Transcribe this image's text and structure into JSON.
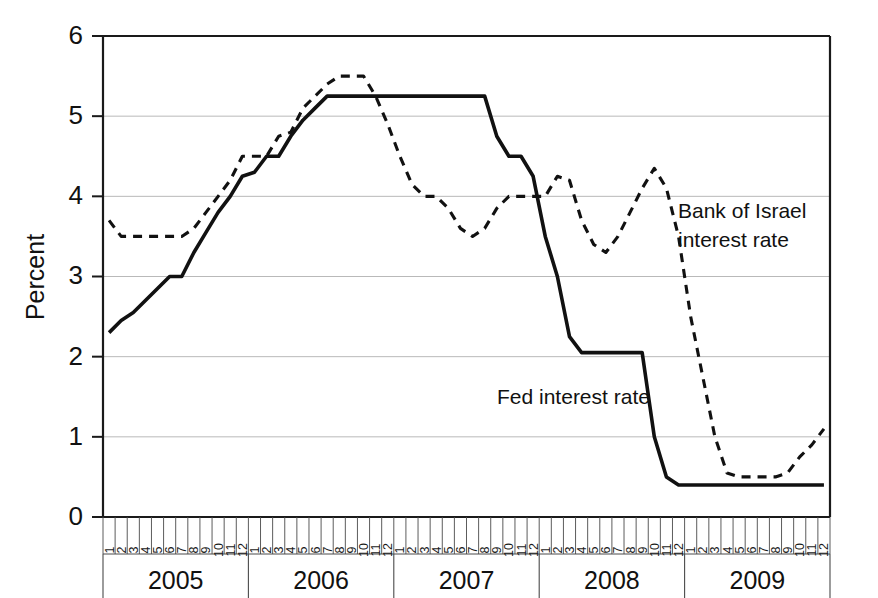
{
  "chart_data": {
    "type": "line",
    "title": "",
    "xlabel": "",
    "ylabel": "Percent",
    "ylim": [
      0,
      6
    ],
    "yticks": [
      0,
      1,
      2,
      3,
      4,
      5,
      6
    ],
    "ytick_labels": [
      "0",
      "1",
      "2",
      "3",
      "4",
      "5",
      "6"
    ],
    "grid": "horizontal",
    "legend_position": "inline-annotation",
    "years": [
      "2005",
      "2006",
      "2007",
      "2008",
      "2009"
    ],
    "months": [
      "1",
      "2",
      "3",
      "4",
      "5",
      "6",
      "7",
      "8",
      "9",
      "10",
      "11",
      "12"
    ],
    "x": [
      "2005-1",
      "2005-2",
      "2005-3",
      "2005-4",
      "2005-5",
      "2005-6",
      "2005-7",
      "2005-8",
      "2005-9",
      "2005-10",
      "2005-11",
      "2005-12",
      "2006-1",
      "2006-2",
      "2006-3",
      "2006-4",
      "2006-5",
      "2006-6",
      "2006-7",
      "2006-8",
      "2006-9",
      "2006-10",
      "2006-11",
      "2006-12",
      "2007-1",
      "2007-2",
      "2007-3",
      "2007-4",
      "2007-5",
      "2007-6",
      "2007-7",
      "2007-8",
      "2007-9",
      "2007-10",
      "2007-11",
      "2007-12",
      "2008-1",
      "2008-2",
      "2008-3",
      "2008-4",
      "2008-5",
      "2008-6",
      "2008-7",
      "2008-8",
      "2008-9",
      "2008-10",
      "2008-11",
      "2008-12",
      "2009-1",
      "2009-2",
      "2009-3",
      "2009-4",
      "2009-5",
      "2009-6",
      "2009-7",
      "2009-8",
      "2009-9",
      "2009-10",
      "2009-11",
      "2009-12"
    ],
    "series": [
      {
        "name": "Fed interest rate",
        "style": "solid",
        "color": "#111111",
        "values": [
          2.3,
          2.45,
          2.55,
          2.7,
          2.85,
          3.0,
          3.0,
          3.3,
          3.55,
          3.8,
          4.0,
          4.25,
          4.3,
          4.5,
          4.5,
          4.75,
          4.95,
          5.1,
          5.25,
          5.25,
          5.25,
          5.25,
          5.25,
          5.25,
          5.25,
          5.25,
          5.25,
          5.25,
          5.25,
          5.25,
          5.25,
          5.25,
          4.75,
          4.5,
          4.5,
          4.25,
          3.5,
          3.0,
          2.25,
          2.05,
          2.05,
          2.05,
          2.05,
          2.05,
          2.05,
          1.0,
          0.5,
          0.4,
          0.4,
          0.4,
          0.4,
          0.4,
          0.4,
          0.4,
          0.4,
          0.4,
          0.4,
          0.4,
          0.4,
          0.4
        ]
      },
      {
        "name": "Bank of Israel interest rate",
        "style": "dashed",
        "color": "#111111",
        "values": [
          3.7,
          3.5,
          3.5,
          3.5,
          3.5,
          3.5,
          3.5,
          3.6,
          3.8,
          4.0,
          4.2,
          4.5,
          4.5,
          4.5,
          4.75,
          4.8,
          5.1,
          5.25,
          5.4,
          5.5,
          5.5,
          5.5,
          5.25,
          4.9,
          4.5,
          4.15,
          4.0,
          4.0,
          3.85,
          3.6,
          3.5,
          3.6,
          3.85,
          4.0,
          4.0,
          4.0,
          4.0,
          4.25,
          4.2,
          3.7,
          3.4,
          3.3,
          3.5,
          3.8,
          4.1,
          4.35,
          4.1,
          3.5,
          2.5,
          1.75,
          1.0,
          0.55,
          0.5,
          0.5,
          0.5,
          0.5,
          0.55,
          0.75,
          0.9,
          1.1
        ]
      }
    ],
    "annotations": [
      {
        "name": "boi-annotation",
        "text_lines": [
          "Bank of Israel",
          "interest rate"
        ],
        "anchor_x": "2008-10",
        "anchor_y": 3.7
      },
      {
        "name": "fed-annotation",
        "text_lines": [
          "Fed interest rate"
        ],
        "anchor_x": "2008-1",
        "anchor_y": 1.5
      }
    ]
  },
  "labels": {
    "y_axis_title": "Percent",
    "annotation_boi_line1": "Bank of Israel",
    "annotation_boi_line2": "interest rate",
    "annotation_fed": "Fed interest rate",
    "ytick_0": "0",
    "ytick_1": "1",
    "ytick_2": "2",
    "ytick_3": "3",
    "ytick_4": "4",
    "ytick_5": "5",
    "ytick_6": "6",
    "year_2005": "2005",
    "year_2006": "2006",
    "year_2007": "2007",
    "year_2008": "2008",
    "year_2009": "2009"
  }
}
